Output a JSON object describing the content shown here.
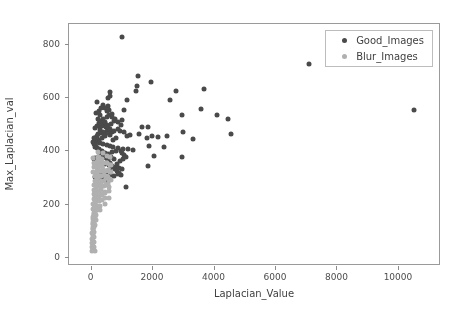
{
  "chart_data": {
    "type": "scatter",
    "title": "",
    "xlabel": "Laplacian_Value",
    "ylabel": "Max_Laplacian_val",
    "xlim": [
      -700,
      11400
    ],
    "ylim": [
      -35,
      875
    ],
    "xticks": [
      0,
      2000,
      4000,
      6000,
      8000,
      10000
    ],
    "xticklabels": [
      "0",
      "2000",
      "4000",
      "6000",
      "8000",
      "10000"
    ],
    "yticks": [
      0,
      200,
      400,
      600,
      800
    ],
    "yticklabels": [
      "0",
      "200",
      "400",
      "600",
      "800"
    ],
    "grid": false,
    "legend_position": "upper right",
    "series": [
      {
        "name": "Good_Images",
        "color": "#4a4a4a",
        "marker": "circle",
        "points": [
          [
            1010,
            825
          ],
          [
            7120,
            725
          ],
          [
            10520,
            550
          ],
          [
            1560,
            678
          ],
          [
            1960,
            658
          ],
          [
            640,
            618
          ],
          [
            630,
            606
          ],
          [
            2780,
            624
          ],
          [
            3700,
            630
          ],
          [
            1500,
            640
          ],
          [
            1480,
            622
          ],
          [
            560,
            598
          ],
          [
            1180,
            588
          ],
          [
            2580,
            588
          ],
          [
            200,
            580
          ],
          [
            3580,
            556
          ],
          [
            1080,
            550
          ],
          [
            4120,
            532
          ],
          [
            2980,
            534
          ],
          [
            4480,
            518
          ],
          [
            520,
            524
          ],
          [
            560,
            566
          ],
          [
            600,
            552
          ],
          [
            700,
            538
          ],
          [
            1020,
            514
          ],
          [
            760,
            512
          ],
          [
            660,
            500
          ],
          [
            420,
            498
          ],
          [
            380,
            492
          ],
          [
            300,
            488
          ],
          [
            500,
            486
          ],
          [
            880,
            480
          ],
          [
            960,
            472
          ],
          [
            1660,
            488
          ],
          [
            1880,
            486
          ],
          [
            3020,
            470
          ],
          [
            3340,
            442
          ],
          [
            4560,
            462
          ],
          [
            2000,
            452
          ],
          [
            2200,
            450
          ],
          [
            2480,
            452
          ],
          [
            1840,
            448
          ],
          [
            1580,
            462
          ],
          [
            1280,
            458
          ],
          [
            840,
            446
          ],
          [
            720,
            440
          ],
          [
            640,
            458
          ],
          [
            480,
            452
          ],
          [
            360,
            446
          ],
          [
            260,
            440
          ],
          [
            180,
            432
          ],
          [
            300,
            428
          ],
          [
            420,
            424
          ],
          [
            540,
            420
          ],
          [
            620,
            416
          ],
          [
            740,
            412
          ],
          [
            900,
            408
          ],
          [
            1060,
            406
          ],
          [
            1220,
            404
          ],
          [
            1380,
            402
          ],
          [
            1900,
            418
          ],
          [
            2380,
            412
          ],
          [
            2060,
            378
          ],
          [
            2980,
            376
          ],
          [
            1880,
            342
          ],
          [
            1140,
            262
          ],
          [
            820,
            396
          ],
          [
            700,
            392
          ],
          [
            580,
            388
          ],
          [
            460,
            384
          ],
          [
            340,
            380
          ],
          [
            240,
            376
          ],
          [
            160,
            372
          ],
          [
            120,
            368
          ],
          [
            200,
            360
          ],
          [
            280,
            356
          ],
          [
            380,
            352
          ],
          [
            480,
            348
          ],
          [
            600,
            344
          ],
          [
            700,
            340
          ],
          [
            820,
            336
          ],
          [
            940,
            332
          ],
          [
            1020,
            328
          ],
          [
            620,
            324
          ],
          [
            520,
            320
          ],
          [
            420,
            316
          ],
          [
            320,
            312
          ],
          [
            240,
            308
          ],
          [
            180,
            304
          ],
          [
            140,
            300
          ],
          [
            260,
            296
          ],
          [
            360,
            292
          ],
          [
            460,
            288
          ],
          [
            560,
            284
          ],
          [
            660,
            306
          ],
          [
            760,
            302
          ],
          [
            880,
            310
          ],
          [
            980,
            306
          ],
          [
            300,
            476
          ],
          [
            340,
            466
          ],
          [
            400,
            470
          ],
          [
            440,
            462
          ],
          [
            520,
            474
          ],
          [
            580,
            466
          ],
          [
            640,
            478
          ],
          [
            700,
            468
          ],
          [
            760,
            474
          ],
          [
            240,
            462
          ],
          [
            200,
            454
          ],
          [
            160,
            446
          ],
          [
            140,
            438
          ],
          [
            120,
            430
          ],
          [
            180,
            418
          ],
          [
            220,
            410
          ],
          [
            260,
            402
          ],
          [
            320,
            394
          ],
          [
            380,
            386
          ],
          [
            440,
            378
          ],
          [
            500,
            370
          ],
          [
            560,
            362
          ],
          [
            620,
            354
          ],
          [
            680,
            346
          ],
          [
            740,
            338
          ],
          [
            800,
            330
          ],
          [
            860,
            322
          ],
          [
            920,
            314
          ],
          [
            980,
            398
          ],
          [
            1040,
            390
          ],
          [
            1100,
            382
          ],
          [
            1160,
            374
          ],
          [
            1060,
            366
          ],
          [
            960,
            358
          ],
          [
            860,
            350
          ],
          [
            760,
            366
          ],
          [
            660,
            374
          ],
          [
            560,
            382
          ],
          [
            460,
            390
          ],
          [
            360,
            398
          ],
          [
            260,
            406
          ],
          [
            160,
            414
          ],
          [
            100,
            422
          ],
          [
            80,
            430
          ],
          [
            120,
            446
          ],
          [
            160,
            484
          ],
          [
            220,
            492
          ],
          [
            280,
            502
          ],
          [
            340,
            510
          ],
          [
            400,
            518
          ],
          [
            460,
            506
          ],
          [
            520,
            496
          ],
          [
            580,
            488
          ],
          [
            640,
            482
          ],
          [
            240,
            518
          ],
          [
            300,
            532
          ],
          [
            180,
            540
          ],
          [
            260,
            548
          ],
          [
            340,
            560
          ],
          [
            420,
            572
          ],
          [
            480,
            560
          ],
          [
            540,
            546
          ],
          [
            600,
            534
          ],
          [
            700,
            526
          ],
          [
            800,
            518
          ],
          [
            900,
            506
          ],
          [
            1000,
            494
          ],
          [
            1100,
            470
          ],
          [
            1200,
            452
          ]
        ]
      },
      {
        "name": "Blur_Images",
        "color": "#b0b0b0",
        "marker": "circle",
        "points": [
          [
            60,
            20
          ],
          [
            70,
            40
          ],
          [
            80,
            58
          ],
          [
            90,
            76
          ],
          [
            100,
            94
          ],
          [
            110,
            112
          ],
          [
            120,
            130
          ],
          [
            130,
            148
          ],
          [
            140,
            166
          ],
          [
            150,
            184
          ],
          [
            160,
            202
          ],
          [
            170,
            220
          ],
          [
            180,
            238
          ],
          [
            190,
            256
          ],
          [
            200,
            274
          ],
          [
            210,
            292
          ],
          [
            220,
            310
          ],
          [
            230,
            328
          ],
          [
            240,
            346
          ],
          [
            250,
            364
          ],
          [
            90,
            148
          ],
          [
            110,
            166
          ],
          [
            130,
            184
          ],
          [
            150,
            202
          ],
          [
            170,
            220
          ],
          [
            190,
            238
          ],
          [
            70,
            130
          ],
          [
            85,
            110
          ],
          [
            95,
            92
          ],
          [
            105,
            74
          ],
          [
            115,
            56
          ],
          [
            125,
            38
          ],
          [
            135,
            22
          ],
          [
            60,
            68
          ],
          [
            70,
            86
          ],
          [
            80,
            104
          ],
          [
            95,
            122
          ],
          [
            105,
            140
          ],
          [
            115,
            158
          ],
          [
            125,
            176
          ],
          [
            135,
            194
          ],
          [
            145,
            212
          ],
          [
            155,
            230
          ],
          [
            165,
            248
          ],
          [
            175,
            266
          ],
          [
            185,
            284
          ],
          [
            195,
            302
          ],
          [
            205,
            320
          ],
          [
            215,
            338
          ],
          [
            225,
            356
          ],
          [
            235,
            300
          ],
          [
            245,
            282
          ],
          [
            255,
            264
          ],
          [
            265,
            246
          ],
          [
            275,
            228
          ],
          [
            285,
            210
          ],
          [
            295,
            192
          ],
          [
            305,
            174
          ],
          [
            315,
            212
          ],
          [
            325,
            236
          ],
          [
            335,
            258
          ],
          [
            345,
            280
          ],
          [
            355,
            302
          ],
          [
            365,
            324
          ],
          [
            375,
            346
          ],
          [
            385,
            368
          ],
          [
            395,
            390
          ],
          [
            405,
            352
          ],
          [
            415,
            330
          ],
          [
            425,
            308
          ],
          [
            435,
            286
          ],
          [
            445,
            264
          ],
          [
            455,
            242
          ],
          [
            465,
            220
          ],
          [
            475,
            198
          ],
          [
            485,
            240
          ],
          [
            495,
            268
          ],
          [
            505,
            296
          ],
          [
            515,
            324
          ],
          [
            525,
            352
          ],
          [
            535,
            380
          ],
          [
            545,
            352
          ],
          [
            555,
            326
          ],
          [
            565,
            300
          ],
          [
            575,
            274
          ],
          [
            585,
            248
          ],
          [
            595,
            222
          ],
          [
            605,
            262
          ],
          [
            615,
            290
          ],
          [
            625,
            318
          ],
          [
            635,
            346
          ],
          [
            645,
            374
          ],
          [
            655,
            346
          ],
          [
            665,
            318
          ],
          [
            675,
            290
          ],
          [
            40,
            36
          ],
          [
            50,
            52
          ],
          [
            55,
            88
          ],
          [
            65,
            106
          ],
          [
            75,
            124
          ],
          [
            85,
            142
          ],
          [
            100,
            160
          ],
          [
            112,
            178
          ],
          [
            124,
            196
          ],
          [
            136,
            214
          ],
          [
            148,
            232
          ],
          [
            160,
            250
          ],
          [
            172,
            268
          ],
          [
            184,
            286
          ],
          [
            196,
            304
          ],
          [
            208,
            322
          ],
          [
            220,
            340
          ],
          [
            232,
            358
          ],
          [
            244,
            376
          ],
          [
            256,
            394
          ],
          [
            268,
            376
          ],
          [
            280,
            358
          ],
          [
            292,
            340
          ],
          [
            304,
            322
          ],
          [
            316,
            304
          ],
          [
            328,
            286
          ],
          [
            340,
            268
          ],
          [
            352,
            250
          ],
          [
            364,
            232
          ],
          [
            376,
            214
          ],
          [
            150,
            120
          ],
          [
            165,
            138
          ],
          [
            180,
            156
          ],
          [
            195,
            174
          ],
          [
            210,
            192
          ],
          [
            120,
            200
          ],
          [
            135,
            218
          ],
          [
            148,
            236
          ],
          [
            100,
            250
          ],
          [
            115,
            268
          ],
          [
            130,
            286
          ],
          [
            145,
            304
          ],
          [
            95,
            318
          ],
          [
            110,
            336
          ],
          [
            125,
            354
          ],
          [
            85,
            372
          ],
          [
            75,
            180
          ],
          [
            88,
            198
          ],
          [
            102,
            216
          ],
          [
            116,
            234
          ]
        ]
      }
    ]
  }
}
